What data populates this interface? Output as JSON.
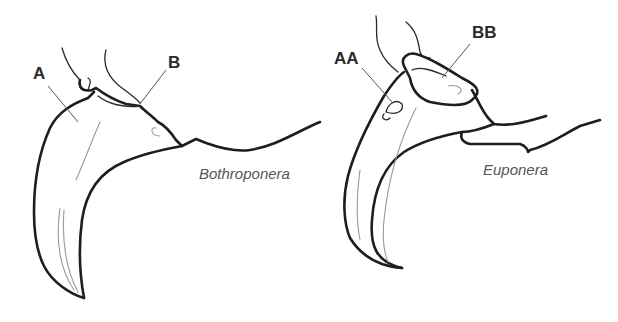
{
  "figure": {
    "panels": [
      {
        "genus": "Bothroponera",
        "labels": {
          "first": "A",
          "second": "B"
        }
      },
      {
        "genus": "Euponera",
        "labels": {
          "first": "AA",
          "second": "BB"
        }
      }
    ],
    "colors": {
      "background": "#ffffff",
      "outline": "#1e1e1e",
      "label_text": "#2b2b2b",
      "genus_text": "#555555"
    }
  }
}
